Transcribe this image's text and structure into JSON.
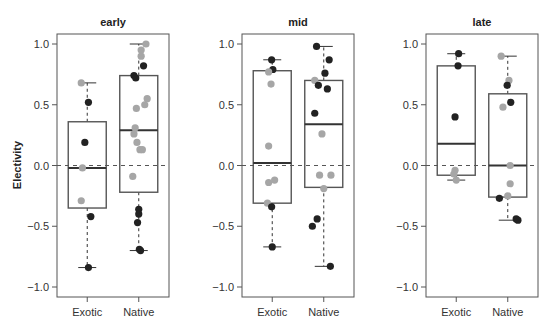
{
  "chart_data": {
    "type": "box",
    "ylabel": "Electivity",
    "ylim": [
      -1.08,
      1.08
    ],
    "yticks": [
      1.0,
      0.5,
      0.0,
      -0.5,
      -1.0
    ],
    "ytick_labels": [
      "1.0",
      "0.5",
      "0.0",
      "−0.5",
      "−1.0"
    ],
    "reference_line": 0.0,
    "categories": [
      "Exotic",
      "Native"
    ],
    "colors": {
      "black_point": "#222222",
      "gray_point": "#a6a6a6"
    },
    "panels": [
      {
        "title": "early",
        "groups": [
          {
            "name": "Exotic",
            "whisker_low": -0.84,
            "q1": -0.35,
            "median": -0.02,
            "q3": 0.36,
            "whisker_high": 0.68,
            "points": [
              {
                "y": 0.68,
                "c": "gray",
                "j": -0.5
              },
              {
                "y": 0.52,
                "c": "black",
                "j": 0.1
              },
              {
                "y": 0.19,
                "c": "black",
                "j": -0.2
              },
              {
                "y": -0.02,
                "c": "gray",
                "j": -0.4
              },
              {
                "y": -0.29,
                "c": "gray",
                "j": -0.5
              },
              {
                "y": -0.42,
                "c": "black",
                "j": 0.3
              },
              {
                "y": -0.84,
                "c": "black",
                "j": 0.1
              }
            ]
          },
          {
            "name": "Native",
            "whisker_low": -0.7,
            "q1": -0.22,
            "median": 0.29,
            "q3": 0.74,
            "whisker_high": 1.0,
            "points": [
              {
                "y": 1.0,
                "c": "gray",
                "j": 0.6
              },
              {
                "y": 0.95,
                "c": "gray",
                "j": 0.2
              },
              {
                "y": 0.9,
                "c": "gray",
                "j": 0.2
              },
              {
                "y": 0.82,
                "c": "black",
                "j": 0.4
              },
              {
                "y": 0.74,
                "c": "black",
                "j": -0.4
              },
              {
                "y": 0.72,
                "c": "black",
                "j": -0.25
              },
              {
                "y": 0.55,
                "c": "gray",
                "j": 0.7
              },
              {
                "y": 0.5,
                "c": "gray",
                "j": 0.5
              },
              {
                "y": 0.47,
                "c": "gray",
                "j": -0.2
              },
              {
                "y": 0.31,
                "c": "gray",
                "j": -0.3
              },
              {
                "y": 0.26,
                "c": "gray",
                "j": -0.4
              },
              {
                "y": 0.19,
                "c": "gray",
                "j": -0.15
              },
              {
                "y": 0.13,
                "c": "gray",
                "j": 0.1
              },
              {
                "y": 0.13,
                "c": "gray",
                "j": 0.3
              },
              {
                "y": -0.09,
                "c": "gray",
                "j": -0.5
              },
              {
                "y": -0.36,
                "c": "black",
                "j": 0.0
              },
              {
                "y": -0.4,
                "c": "black",
                "j": 0.0
              },
              {
                "y": -0.47,
                "c": "black",
                "j": -0.1
              },
              {
                "y": -0.69,
                "c": "black",
                "j": 0.05
              },
              {
                "y": -0.7,
                "c": "black",
                "j": 0.15
              }
            ]
          }
        ]
      },
      {
        "title": "mid",
        "groups": [
          {
            "name": "Exotic",
            "whisker_low": -0.67,
            "q1": -0.31,
            "median": 0.02,
            "q3": 0.78,
            "whisker_high": 0.87,
            "points": [
              {
                "y": 0.87,
                "c": "black",
                "j": -0.05
              },
              {
                "y": 0.79,
                "c": "black",
                "j": 0.05
              },
              {
                "y": 0.77,
                "c": "gray",
                "j": -0.3
              },
              {
                "y": 0.67,
                "c": "gray",
                "j": -0.1
              },
              {
                "y": 0.16,
                "c": "gray",
                "j": -0.3
              },
              {
                "y": -0.12,
                "c": "gray",
                "j": 0.2
              },
              {
                "y": -0.14,
                "c": "gray",
                "j": -0.3
              },
              {
                "y": -0.31,
                "c": "gray",
                "j": -0.4
              },
              {
                "y": -0.34,
                "c": "black",
                "j": -0.05
              },
              {
                "y": -0.67,
                "c": "black",
                "j": 0.0
              }
            ]
          },
          {
            "name": "Native",
            "whisker_low": -0.83,
            "q1": -0.18,
            "median": 0.34,
            "q3": 0.7,
            "whisker_high": 0.98,
            "points": [
              {
                "y": 0.98,
                "c": "black",
                "j": -0.6
              },
              {
                "y": 0.87,
                "c": "black",
                "j": 0.45
              },
              {
                "y": 0.76,
                "c": "black",
                "j": 0.1
              },
              {
                "y": 0.7,
                "c": "gray",
                "j": -0.75
              },
              {
                "y": 0.66,
                "c": "black",
                "j": -0.45
              },
              {
                "y": 0.63,
                "c": "black",
                "j": 0.3
              },
              {
                "y": 0.43,
                "c": "black",
                "j": -0.75
              },
              {
                "y": 0.26,
                "c": "gray",
                "j": -0.15
              },
              {
                "y": -0.08,
                "c": "gray",
                "j": -0.35
              },
              {
                "y": -0.08,
                "c": "gray",
                "j": 0.6
              },
              {
                "y": -0.19,
                "c": "gray",
                "j": 0.0
              },
              {
                "y": -0.44,
                "c": "black",
                "j": -0.55
              },
              {
                "y": -0.5,
                "c": "black",
                "j": -0.95
              },
              {
                "y": -0.83,
                "c": "black",
                "j": 0.55
              }
            ]
          }
        ]
      },
      {
        "title": "late",
        "groups": [
          {
            "name": "Exotic",
            "whisker_low": -0.12,
            "q1": -0.08,
            "median": 0.18,
            "q3": 0.82,
            "whisker_high": 0.92,
            "points": [
              {
                "y": 0.92,
                "c": "black",
                "j": 0.2
              },
              {
                "y": 0.82,
                "c": "black",
                "j": 0.15
              },
              {
                "y": 0.4,
                "c": "black",
                "j": -0.1
              },
              {
                "y": -0.04,
                "c": "gray",
                "j": -0.1
              },
              {
                "y": -0.07,
                "c": "gray",
                "j": -0.2
              },
              {
                "y": -0.12,
                "c": "gray",
                "j": 0.0
              }
            ]
          },
          {
            "name": "Native",
            "whisker_low": -0.45,
            "q1": -0.26,
            "median": 0.0,
            "q3": 0.59,
            "whisker_high": 0.9,
            "points": [
              {
                "y": 0.9,
                "c": "gray",
                "j": -0.55
              },
              {
                "y": 0.7,
                "c": "gray",
                "j": 0.1
              },
              {
                "y": 0.66,
                "c": "black",
                "j": -0.05
              },
              {
                "y": 0.52,
                "c": "black",
                "j": 0.25
              },
              {
                "y": 0.48,
                "c": "gray",
                "j": -0.4
              },
              {
                "y": 0.0,
                "c": "gray",
                "j": 0.2
              },
              {
                "y": -0.15,
                "c": "gray",
                "j": 0.2
              },
              {
                "y": -0.25,
                "c": "gray",
                "j": 0.0
              },
              {
                "y": -0.27,
                "c": "black",
                "j": -0.7
              },
              {
                "y": -0.44,
                "c": "black",
                "j": 0.7
              },
              {
                "y": -0.45,
                "c": "black",
                "j": 0.85
              }
            ]
          }
        ]
      }
    ]
  }
}
